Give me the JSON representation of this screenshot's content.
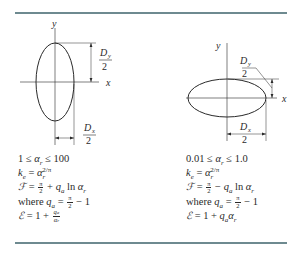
{
  "figure": {
    "left_case": {
      "shape": "tall ellipse (prolate along y)",
      "axis_labels": {
        "x": "x",
        "y": "y"
      },
      "dimension_labels": {
        "dy": {
          "num": "D",
          "sub": "y",
          "den": "2"
        },
        "dx": {
          "num": "D",
          "sub": "x",
          "den": "2"
        }
      },
      "formulas": {
        "range": {
          "lo": "1",
          "var": "α",
          "var_sub": "r",
          "hi": "100"
        },
        "ke": {
          "lhs": "k",
          "lhs_sub": "e",
          "base": "α",
          "base_sub": "r",
          "exp": "2/π"
        },
        "F": {
          "lhs": "ℱ",
          "pi_num": "π",
          "pi_den": "2",
          "op": "+",
          "q": "q",
          "q_sub": "a",
          "ln": "ln",
          "arg": "α",
          "arg_sub": "r"
        },
        "where": {
          "word": "where",
          "q": "q",
          "q_sub": "a",
          "pi_num": "π",
          "pi_den": "2",
          "rhs": "− 1"
        },
        "E": {
          "lhs": "ℰ",
          "one": "1",
          "op": "+",
          "frac_num": "q",
          "frac_num_sub": "a",
          "frac_den": "α",
          "frac_den_sub": "r"
        }
      }
    },
    "right_case": {
      "shape": "wide ellipse (oblate along x)",
      "axis_labels": {
        "x": "x",
        "y": "y"
      },
      "dimension_labels": {
        "dy": {
          "num": "D",
          "sub": "y",
          "den": "2"
        },
        "dx": {
          "num": "D",
          "sub": "x",
          "den": "2"
        }
      },
      "formulas": {
        "range": {
          "lo": "0.01",
          "var": "α",
          "var_sub": "r",
          "hi": "1.0"
        },
        "ke": {
          "lhs": "k",
          "lhs_sub": "e",
          "base": "α",
          "base_sub": "r",
          "exp": "2/π"
        },
        "F": {
          "lhs": "ℱ",
          "pi_num": "π",
          "pi_den": "2",
          "op": "−",
          "q": "q",
          "q_sub": "a",
          "ln": "ln",
          "arg": "α",
          "arg_sub": "r"
        },
        "where": {
          "word": "where",
          "q": "q",
          "q_sub": "a",
          "pi_num": "π",
          "pi_den": "2",
          "rhs": "− 1"
        },
        "E": {
          "lhs": "ℰ",
          "one": "1",
          "op": "+",
          "q": "q",
          "q_sub": "a",
          "arg": "α",
          "arg_sub": "r"
        }
      }
    },
    "colors": {
      "rule": "#6e8a90",
      "ink": "#2a2a2a",
      "background": "#ffffff"
    }
  }
}
